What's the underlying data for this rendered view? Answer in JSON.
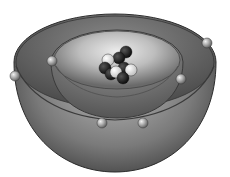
{
  "diagram": {
    "type": "atom-shell-model-cutaway",
    "colors": {
      "background": "#ffffff",
      "outer_shell_light": "#b8b8b8",
      "outer_shell_dark": "#3a3a3a",
      "inner_shell_light": "#e6e6e6",
      "inner_shell_dark": "#5a5a5a",
      "proton_color": "#141414",
      "neutron_color": "#f2f2f2",
      "electron_color": "#9a9a9a"
    },
    "outer_shell": {
      "rim": {
        "cx": 115,
        "cy": 62,
        "rx": 101,
        "ry": 48
      },
      "bottom_y": 172,
      "electrons": [
        {
          "cx": 15,
          "cy": 76
        },
        {
          "cx": 207,
          "cy": 43
        }
      ]
    },
    "inner_shell": {
      "rim": {
        "cx": 117,
        "cy": 62,
        "rx": 66,
        "ry": 32
      },
      "bottom_y": 118,
      "electrons": [
        {
          "cx": 52,
          "cy": 61
        },
        {
          "cx": 181,
          "cy": 79
        },
        {
          "cx": 102,
          "cy": 123
        },
        {
          "cx": 143,
          "cy": 123
        }
      ]
    },
    "nucleus": {
      "particles": [
        {
          "cx": 126,
          "cy": 52,
          "kind": "dark"
        },
        {
          "cx": 119,
          "cy": 58,
          "kind": "dark"
        },
        {
          "cx": 108,
          "cy": 60,
          "kind": "light"
        },
        {
          "cx": 105,
          "cy": 68,
          "kind": "dark"
        },
        {
          "cx": 124,
          "cy": 68,
          "kind": "dark"
        },
        {
          "cx": 131,
          "cy": 70,
          "kind": "light"
        },
        {
          "cx": 111,
          "cy": 74,
          "kind": "dark"
        },
        {
          "cx": 116,
          "cy": 72,
          "kind": "light"
        },
        {
          "cx": 123,
          "cy": 78,
          "kind": "dark"
        }
      ]
    }
  }
}
